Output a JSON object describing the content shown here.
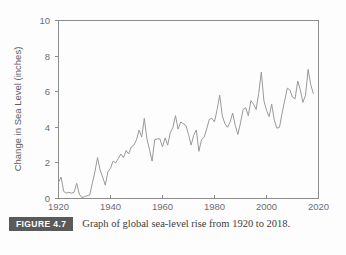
{
  "figure": {
    "badge_label": "FIGURE 4.7",
    "caption": "Graph of global sea-level rise from 1920 to 2018."
  },
  "chart_data": {
    "type": "line",
    "title": "",
    "subtitle": "",
    "xlabel": "",
    "ylabel": "Change in Sea Level (inches)",
    "xlim": [
      1920,
      2020
    ],
    "ylim": [
      0,
      10
    ],
    "xticks": [
      1920,
      1940,
      1960,
      1980,
      2000,
      2020
    ],
    "yticks": [
      0,
      2,
      4,
      6,
      8,
      10
    ],
    "grid": false,
    "legend": false,
    "legend_position": "none",
    "line_color": "#9a9a9a",
    "axis_color": "#8c8c8c",
    "text_color": "#6e6e6e",
    "series": [
      {
        "name": "Global sea-level rise",
        "x": [
          1920,
          1921,
          1922,
          1923,
          1924,
          1925,
          1926,
          1927,
          1928,
          1929,
          1930,
          1931,
          1932,
          1933,
          1934,
          1935,
          1936,
          1937,
          1938,
          1939,
          1940,
          1941,
          1942,
          1943,
          1944,
          1945,
          1946,
          1947,
          1948,
          1949,
          1950,
          1951,
          1952,
          1953,
          1954,
          1955,
          1956,
          1957,
          1958,
          1959,
          1960,
          1961,
          1962,
          1963,
          1964,
          1965,
          1966,
          1967,
          1968,
          1969,
          1970,
          1971,
          1972,
          1973,
          1974,
          1975,
          1976,
          1977,
          1978,
          1979,
          1980,
          1981,
          1982,
          1983,
          1984,
          1985,
          1986,
          1987,
          1988,
          1989,
          1990,
          1991,
          1992,
          1993,
          1994,
          1995,
          1996,
          1997,
          1998,
          1999,
          2000,
          2001,
          2002,
          2003,
          2004,
          2005,
          2006,
          2007,
          2008,
          2009,
          2010,
          2011,
          2012,
          2013,
          2014,
          2015,
          2016,
          2017,
          2018
        ],
        "values": [
          0.9,
          1.2,
          0.4,
          0.3,
          0.35,
          0.3,
          0.35,
          0.85,
          0.25,
          0.05,
          0.1,
          0.15,
          0.2,
          0.85,
          1.5,
          2.3,
          1.6,
          1.2,
          0.75,
          1.5,
          1.7,
          2.1,
          2.0,
          2.25,
          2.5,
          2.3,
          2.7,
          2.5,
          2.9,
          3.0,
          3.3,
          3.85,
          3.45,
          4.5,
          3.35,
          2.75,
          2.1,
          3.3,
          3.35,
          3.35,
          2.9,
          3.4,
          3.0,
          3.7,
          4.0,
          4.65,
          3.9,
          4.3,
          4.2,
          4.1,
          3.6,
          3.0,
          3.55,
          3.85,
          2.65,
          3.3,
          3.45,
          3.9,
          4.45,
          4.5,
          4.3,
          5.0,
          5.8,
          4.65,
          4.2,
          4.0,
          4.3,
          4.8,
          4.1,
          3.6,
          4.25,
          5.0,
          5.1,
          4.65,
          5.5,
          5.3,
          5.0,
          5.9,
          7.1,
          5.5,
          4.95,
          4.6,
          5.3,
          4.4,
          3.95,
          4.0,
          4.8,
          5.5,
          6.2,
          6.1,
          5.7,
          5.6,
          6.6,
          6.1,
          5.4,
          5.8,
          7.25,
          6.4,
          5.9
        ]
      }
    ]
  }
}
